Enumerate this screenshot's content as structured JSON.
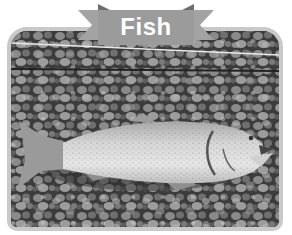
{
  "banner": {
    "title": "Fish"
  },
  "photo": {
    "subject": "trout lying on gravel",
    "colors": {
      "frame": "#c9c9c9",
      "ribbon": "#9b9b9b",
      "ribbon_fold": "#6e6e6e",
      "label": "#ffffff"
    }
  }
}
